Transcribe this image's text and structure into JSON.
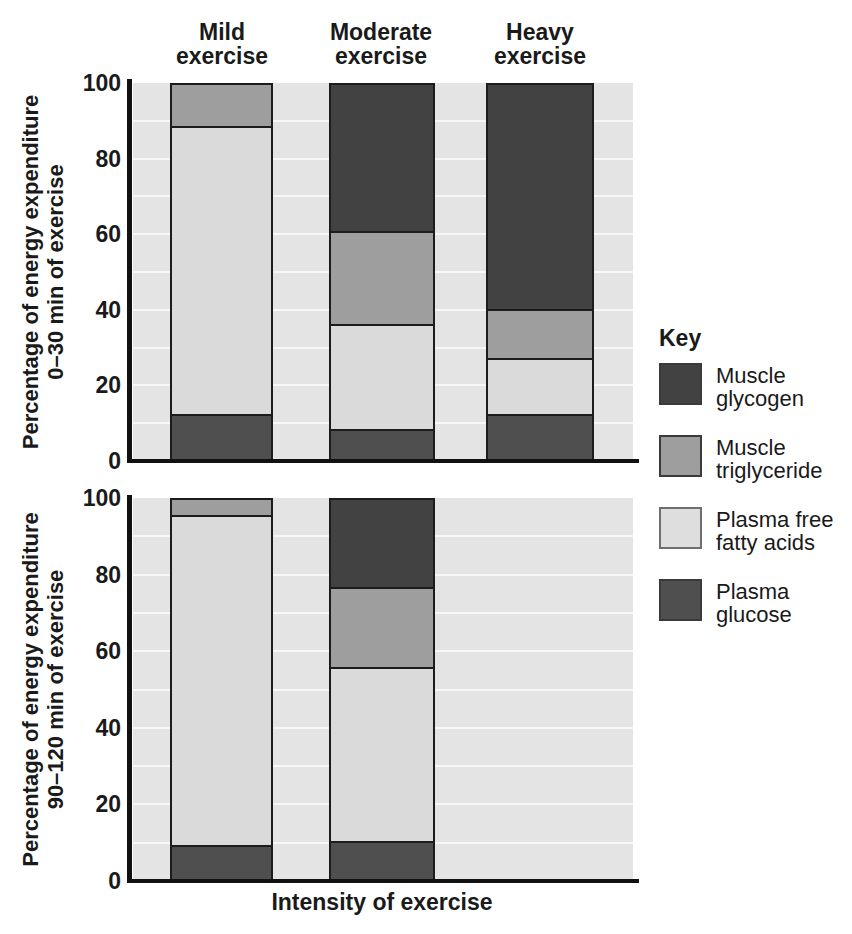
{
  "figure": {
    "column_headings": [
      {
        "line1": "Mild",
        "line2": "exercise"
      },
      {
        "line1": "Moderate",
        "line2": "exercise"
      },
      {
        "line1": "Heavy",
        "line2": "exercise"
      }
    ],
    "x_axis_title": "Intensity of exercise",
    "key": {
      "title": "Key",
      "items": [
        {
          "label_line1": "Muscle",
          "label_line2": "glycogen",
          "color": "#424242"
        },
        {
          "label_line1": "Muscle",
          "label_line2": "triglyceride",
          "color": "#9e9e9e"
        },
        {
          "label_line1": "Plasma free",
          "label_line2": "fatty acids",
          "color": "#dedede"
        },
        {
          "label_line1": "Plasma",
          "label_line2": "glucose",
          "color": "#4f4f4f"
        }
      ]
    },
    "colors": {
      "plot_background": "#e4e4e4",
      "gridline": "#f7f7f7",
      "axis": "#111111",
      "bar_border": "#1c1c1c"
    }
  },
  "chart_data": [
    {
      "type": "bar",
      "stacked": true,
      "ylabel_line1": "Percentage of energy expenditure",
      "ylabel_line2": "0–30 min of exercise",
      "xlabel": "Intensity of exercise",
      "categories": [
        "Mild exercise",
        "Moderate exercise",
        "Heavy exercise"
      ],
      "y_ticks": [
        0,
        20,
        40,
        60,
        80,
        100
      ],
      "ylim": [
        0,
        100
      ],
      "grid": true,
      "legend_position": "right",
      "series": [
        {
          "name": "Plasma glucose",
          "color": "#4f4f4f",
          "values": [
            12,
            8,
            12
          ]
        },
        {
          "name": "Plasma free fatty acids",
          "color": "#dadada",
          "values": [
            77,
            28,
            15
          ]
        },
        {
          "name": "Muscle triglyceride",
          "color": "#9e9e9e",
          "values": [
            11,
            25,
            13
          ]
        },
        {
          "name": "Muscle glycogen",
          "color": "#424242",
          "values": [
            0,
            39,
            60
          ]
        }
      ]
    },
    {
      "type": "bar",
      "stacked": true,
      "ylabel_line1": "Percentage of energy expenditure",
      "ylabel_line2": "90–120 min of exercise",
      "xlabel": "Intensity of exercise",
      "categories": [
        "Mild exercise",
        "Moderate exercise",
        "Heavy exercise"
      ],
      "y_ticks": [
        0,
        20,
        40,
        60,
        80,
        100
      ],
      "ylim": [
        0,
        100
      ],
      "grid": true,
      "series": [
        {
          "name": "Plasma glucose",
          "color": "#4f4f4f",
          "values": [
            9,
            10,
            null
          ]
        },
        {
          "name": "Plasma free fatty acids",
          "color": "#dadada",
          "values": [
            87,
            46,
            null
          ]
        },
        {
          "name": "Muscle triglyceride",
          "color": "#9e9e9e",
          "values": [
            4,
            21,
            null
          ]
        },
        {
          "name": "Muscle glycogen",
          "color": "#424242",
          "values": [
            0,
            23,
            null
          ]
        }
      ]
    }
  ]
}
